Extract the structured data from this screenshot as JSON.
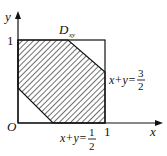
{
  "diagram": {
    "axes": {
      "x_label": "x",
      "y_label": "y",
      "origin_label": "O"
    },
    "ticks": {
      "x_one": "1",
      "y_one": "1"
    },
    "region_label": {
      "main": "D",
      "sub": "xy"
    },
    "lines": [
      {
        "lhs": "x+y=",
        "num": "3",
        "den": "2"
      },
      {
        "lhs": "x+y=",
        "num": "1",
        "den": "2"
      }
    ],
    "colors": {
      "stroke": "#111111",
      "background": "#ffffff"
    }
  }
}
